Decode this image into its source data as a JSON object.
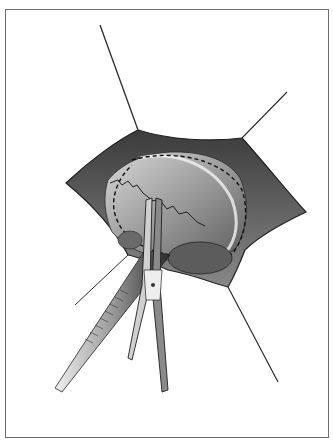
{
  "figure": {
    "type": "surgical-illustration",
    "style": "grayscale pencil drawing",
    "elements": {
      "retraction_sutures": 4,
      "instruments": [
        "forceps",
        "hemostat clamp"
      ],
      "dashed_line": "planned incision outline"
    },
    "colors": {
      "frame": "#6e6e6e",
      "ink_dark": "#1e1e1e",
      "tissue_mid": "#7a7a7a",
      "tissue_light": "#cfcfcf",
      "background": "#ffffff"
    }
  }
}
